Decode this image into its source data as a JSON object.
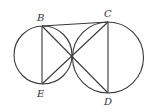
{
  "diagram": {
    "type": "geometry",
    "circles": [
      {
        "name": "left-circle",
        "cx": 43,
        "cy": 55,
        "r": 29
      },
      {
        "name": "right-circle",
        "cx": 108,
        "cy": 57.5,
        "r": 35.5
      }
    ],
    "tangent_point": {
      "x": 72,
      "y": 56
    },
    "points": {
      "B": {
        "label": "B",
        "x": 42,
        "y": 26
      },
      "C": {
        "label": "C",
        "x": 108,
        "y": 22
      },
      "D": {
        "label": "D",
        "x": 108,
        "y": 93
      },
      "E": {
        "label": "E",
        "x": 42,
        "y": 84
      }
    },
    "segments": [
      [
        "B",
        "C"
      ],
      [
        "B",
        "E"
      ],
      [
        "C",
        "D"
      ],
      [
        "B",
        "D"
      ],
      [
        "C",
        "E"
      ]
    ]
  }
}
